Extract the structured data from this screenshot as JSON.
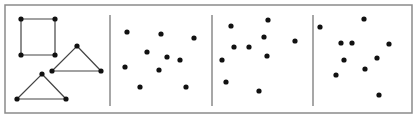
{
  "figure": {
    "width": 415,
    "height": 119,
    "background": "#ffffff",
    "frame": {
      "x": 5,
      "y": 5,
      "width": 407,
      "height": 108,
      "stroke": "#8a8a8a",
      "stroke_width": 1.5
    },
    "dividers": [
      {
        "x": 110,
        "y1": 15,
        "y2": 106
      },
      {
        "x": 212,
        "y1": 15,
        "y2": 106
      },
      {
        "x": 313,
        "y1": 15,
        "y2": 106
      }
    ],
    "divider_color": "#8a8a8a",
    "dot_color": "#111111",
    "dot_radius": 2.6,
    "edge_color": "#444444",
    "panels": [
      {
        "id": "panel-shapes",
        "shapes": [
          {
            "type": "square",
            "points": [
              [
                21,
                19
              ],
              [
                55,
                19
              ],
              [
                55,
                55
              ],
              [
                21,
                55
              ]
            ]
          },
          {
            "type": "triangle",
            "points": [
              [
                77,
                46
              ],
              [
                101,
                71
              ],
              [
                52,
                71
              ]
            ]
          },
          {
            "type": "triangle",
            "points": [
              [
                42,
                74
              ],
              [
                66,
                99
              ],
              [
                17,
                99
              ]
            ]
          }
        ]
      },
      {
        "id": "panel-points-1",
        "points": [
          [
            127,
            32
          ],
          [
            161,
            34
          ],
          [
            194,
            38
          ],
          [
            147,
            52
          ],
          [
            167,
            57
          ],
          [
            180,
            60
          ],
          [
            125,
            67
          ],
          [
            159,
            70
          ],
          [
            140,
            87
          ],
          [
            186,
            87
          ]
        ]
      },
      {
        "id": "panel-points-2",
        "points": [
          [
            231,
            26
          ],
          [
            268,
            20
          ],
          [
            264,
            37
          ],
          [
            295,
            41
          ],
          [
            234,
            47
          ],
          [
            249,
            47
          ],
          [
            267,
            56
          ],
          [
            222,
            60
          ],
          [
            226,
            82
          ],
          [
            259,
            91
          ]
        ]
      },
      {
        "id": "panel-points-3",
        "points": [
          [
            320,
            27
          ],
          [
            364,
            19
          ],
          [
            341,
            43
          ],
          [
            352,
            43
          ],
          [
            389,
            44
          ],
          [
            344,
            60
          ],
          [
            377,
            58
          ],
          [
            365,
            69
          ],
          [
            336,
            75
          ],
          [
            379,
            95
          ]
        ]
      }
    ]
  }
}
